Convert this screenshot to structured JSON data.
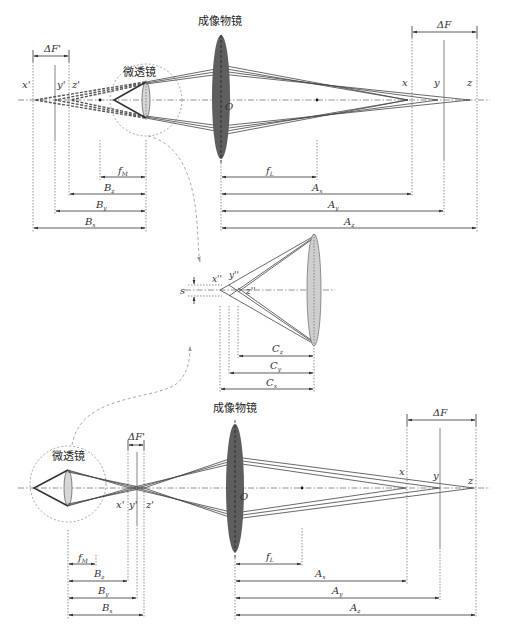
{
  "top_panel": {
    "objective_label": "成像物镜",
    "microlens_label": "微透镜",
    "origin_label": "O",
    "delta_f_prime": "ΔF'",
    "delta_f": "ΔF",
    "virtual_points": [
      "x'",
      "y'",
      "z'"
    ],
    "image_points": [
      "x",
      "y",
      "z"
    ],
    "left_dims": [
      {
        "base": "f",
        "sub": "M"
      },
      {
        "base": "B",
        "sub": "z"
      },
      {
        "base": "B",
        "sub": "y"
      },
      {
        "base": "B",
        "sub": "x"
      }
    ],
    "right_dims": [
      {
        "base": "f",
        "sub": "L"
      },
      {
        "base": "A",
        "sub": "x"
      },
      {
        "base": "A",
        "sub": "y"
      },
      {
        "base": "A",
        "sub": "z"
      }
    ]
  },
  "middle_panel": {
    "offset_label": "s",
    "points": [
      "x''",
      "y''",
      "z''"
    ],
    "dims": [
      {
        "base": "C",
        "sub": "z"
      },
      {
        "base": "C",
        "sub": "y"
      },
      {
        "base": "C",
        "sub": "x"
      }
    ]
  },
  "bottom_panel": {
    "objective_label": "成像物镜",
    "microlens_label": "微透镜",
    "origin_label": "O",
    "delta_f_prime": "ΔF'",
    "delta_f": "ΔF",
    "intermediate_points": [
      "x'",
      "y'",
      "z'"
    ],
    "image_points": [
      "x",
      "y",
      "z"
    ],
    "left_dims": [
      {
        "base": "f",
        "sub": "M"
      },
      {
        "base": "B",
        "sub": "z"
      },
      {
        "base": "B",
        "sub": "y"
      },
      {
        "base": "B",
        "sub": "x"
      }
    ],
    "right_dims": [
      {
        "base": "f",
        "sub": "L"
      },
      {
        "base": "A",
        "sub": "x"
      },
      {
        "base": "A",
        "sub": "y"
      },
      {
        "base": "A",
        "sub": "z"
      }
    ]
  },
  "colors": {
    "objective_fill": "#5a5a5a",
    "microlens_fill": "#cfcfcf",
    "line": "#333333",
    "guide": "#777777"
  }
}
